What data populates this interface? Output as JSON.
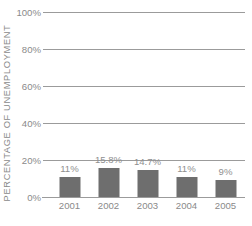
{
  "chart_data": {
    "type": "bar",
    "title": "",
    "subtitle": "",
    "xlabel": "",
    "ylabel": "PERCENTAGE OF UNEMPLOYMENT",
    "categories": [
      "2001",
      "2002",
      "2003",
      "2004",
      "2005"
    ],
    "values": [
      11,
      15.8,
      14.7,
      11,
      9
    ],
    "data_labels": [
      "11%",
      "15.8%",
      "14.7%",
      "11%",
      "9%"
    ],
    "ylim": [
      0,
      100
    ],
    "y_ticks": [
      0,
      20,
      40,
      60,
      80,
      100
    ],
    "y_tick_labels": [
      "0%",
      "20%",
      "40%",
      "60%",
      "80%",
      "100%"
    ],
    "grid": true,
    "grid_axis": "y",
    "legend": false,
    "legend_position": "none",
    "series": [
      {
        "name": "Percentage of unemployment",
        "values": [
          11,
          15.8,
          14.7,
          11,
          9
        ]
      }
    ]
  },
  "colors": {
    "background": "#ffffff",
    "bar_fill": "#6e6e6e",
    "gridline": "#9b9b9b",
    "axis_text": "#8a8a8a",
    "data_label_text": "#8f8f8f"
  }
}
